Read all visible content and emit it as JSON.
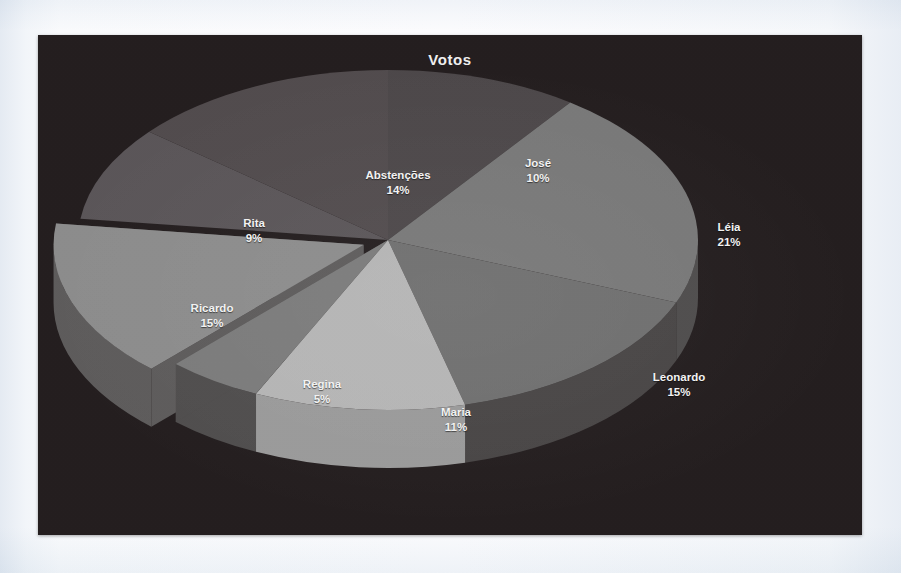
{
  "page": {
    "background_color": "#eef2f7",
    "panel_background_color": "#231d1e"
  },
  "chart_panel": {
    "title": "Votos"
  },
  "chart_data": {
    "type": "pie",
    "title": "Votos",
    "xlabel": "",
    "ylabel": "",
    "units": "percent",
    "total": 100,
    "start_angle_deg": 0,
    "direction": "clockwise",
    "three_d": true,
    "legend_position": "none",
    "labels_inside_slices": true,
    "exploded_slice": "Ricardo",
    "categories": [
      "José",
      "Léia",
      "Leonardo",
      "Maria",
      "Regina",
      "Ricardo",
      "Rita",
      "Abstenções"
    ],
    "values": [
      10,
      21,
      15,
      11,
      5,
      15,
      9,
      14
    ],
    "slices": [
      {
        "label": "José",
        "value": 10,
        "percent_text": "10%",
        "color": "#4c4749",
        "side_color": "#322c2e",
        "exploded": false,
        "label_x": 500,
        "label_y": 136
      },
      {
        "label": "Léia",
        "value": 21,
        "percent_text": "21%",
        "color": "#787878",
        "side_color": "#4e4c4c",
        "exploded": false,
        "label_x": 691,
        "label_y": 200
      },
      {
        "label": "Leonardo",
        "value": 15,
        "percent_text": "15%",
        "color": "#6f6f6f",
        "side_color": "#484545",
        "exploded": false,
        "label_x": 641,
        "label_y": 350
      },
      {
        "label": "Maria",
        "value": 11,
        "percent_text": "11%",
        "color": "#b5b5b5",
        "side_color": "#9a9a9a",
        "exploded": false,
        "label_x": 418,
        "label_y": 385
      },
      {
        "label": "Regina",
        "value": 5,
        "percent_text": "5%",
        "color": "#7b7b7b",
        "side_color": "#4f4d4d",
        "exploded": false,
        "label_x": 284,
        "label_y": 357
      },
      {
        "label": "Ricardo",
        "value": 15,
        "percent_text": "15%",
        "color": "#8c8c8c",
        "side_color": "#5d5b5b",
        "exploded": true,
        "label_x": 174,
        "label_y": 281
      },
      {
        "label": "Rita",
        "value": 9,
        "percent_text": "9%",
        "color": "#5a5558",
        "side_color": "#3a3537",
        "exploded": false,
        "label_x": 216,
        "label_y": 196
      },
      {
        "label": "Abstenções",
        "value": 14,
        "percent_text": "14%",
        "color": "#514b4d",
        "side_color": "#352f31",
        "exploded": false,
        "label_x": 360,
        "label_y": 148
      }
    ]
  }
}
